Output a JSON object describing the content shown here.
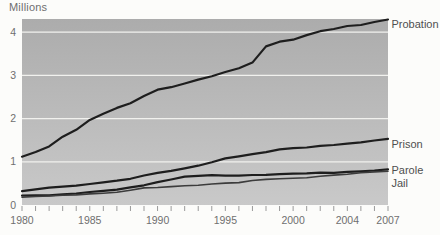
{
  "chart_data": {
    "type": "line",
    "title": "",
    "ylabel": "Millions",
    "xlabel": "",
    "xlim": [
      1980,
      2007
    ],
    "ylim": [
      0,
      4.3
    ],
    "grid": "horizontal",
    "legend_position": "right-of-line-ends",
    "yticks": [
      0,
      1,
      2,
      3,
      4
    ],
    "xticks_labeled": [
      1980,
      1985,
      1990,
      1995,
      2000,
      2004,
      2007
    ],
    "x": [
      1980,
      1981,
      1982,
      1983,
      1984,
      1985,
      1986,
      1987,
      1988,
      1989,
      1990,
      1991,
      1992,
      1993,
      1994,
      1995,
      1996,
      1997,
      1998,
      1999,
      2000,
      2001,
      2002,
      2003,
      2004,
      2005,
      2006,
      2007
    ],
    "series": [
      {
        "name": "Probation",
        "values": [
          1.118,
          1.226,
          1.357,
          1.582,
          1.74,
          1.969,
          2.114,
          2.247,
          2.356,
          2.522,
          2.67,
          2.728,
          2.812,
          2.903,
          2.981,
          3.078,
          3.165,
          3.297,
          3.671,
          3.78,
          3.826,
          3.932,
          4.024,
          4.074,
          4.143,
          4.166,
          4.237,
          4.293
        ]
      },
      {
        "name": "Prison",
        "values": [
          0.32,
          0.36,
          0.402,
          0.423,
          0.448,
          0.487,
          0.526,
          0.562,
          0.607,
          0.683,
          0.743,
          0.792,
          0.85,
          0.909,
          0.99,
          1.078,
          1.128,
          1.177,
          1.224,
          1.287,
          1.316,
          1.33,
          1.367,
          1.39,
          1.421,
          1.448,
          1.492,
          1.532
        ]
      },
      {
        "name": "Parole",
        "values": [
          0.22,
          0.225,
          0.224,
          0.246,
          0.266,
          0.3,
          0.326,
          0.355,
          0.408,
          0.456,
          0.531,
          0.59,
          0.658,
          0.676,
          0.69,
          0.679,
          0.68,
          0.695,
          0.696,
          0.714,
          0.724,
          0.732,
          0.751,
          0.745,
          0.766,
          0.78,
          0.799,
          0.826
        ]
      },
      {
        "name": "Jail",
        "values": [
          0.184,
          0.196,
          0.209,
          0.224,
          0.234,
          0.257,
          0.274,
          0.295,
          0.343,
          0.395,
          0.405,
          0.426,
          0.444,
          0.459,
          0.486,
          0.507,
          0.518,
          0.567,
          0.592,
          0.606,
          0.621,
          0.631,
          0.665,
          0.691,
          0.714,
          0.747,
          0.766,
          0.78
        ]
      }
    ],
    "colors": {
      "line": "#1e1e1e",
      "jail_line": "#3c3c3c",
      "plot_bg_top": "#acacac",
      "plot_bg_bottom": "#c9c9c9",
      "gridline": "#f1f1ee",
      "axis_text": "#6f6f6f",
      "series_label_text": "#4f4f4f",
      "page_bg": "#fcfcfa"
    }
  }
}
